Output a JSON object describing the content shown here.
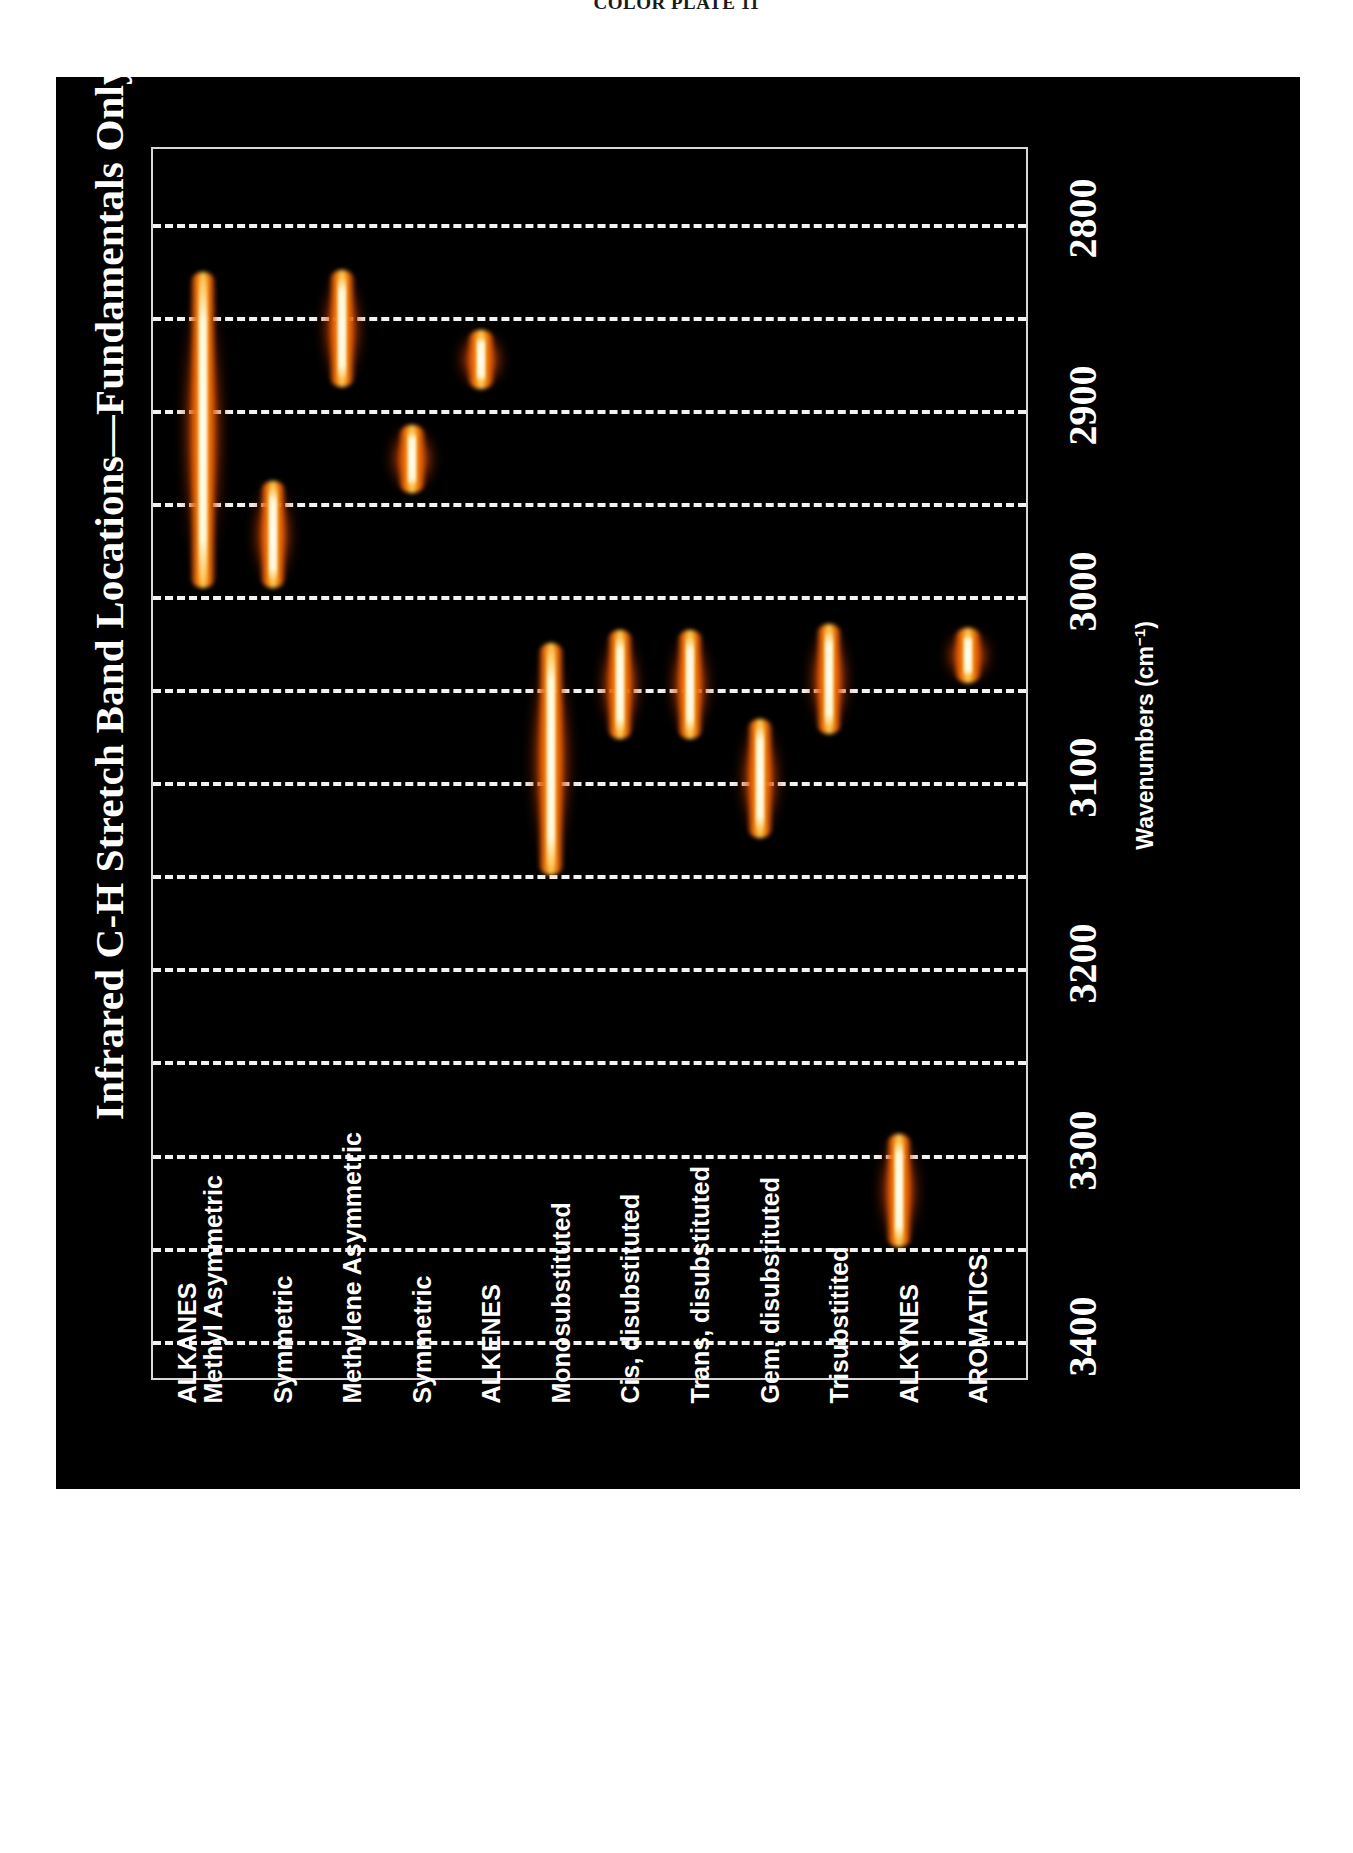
{
  "plate_caption": "COLOR PLATE 11",
  "chart_title": "Infrared C-H Stretch Band Locations—Fundamentals Only",
  "axis": {
    "title_main": "Wavenumbers (cm",
    "title_sup": "−1",
    "title_close": ")",
    "title_full": "Wavenumbers (cm−1)",
    "ticks": [
      "2800",
      "2900",
      "3000",
      "3100",
      "3200",
      "3300",
      "3400"
    ]
  },
  "colors": {
    "panel_background": "#000000",
    "page_background": "#ffffff",
    "gridline": "#f2f2f2",
    "axis_line": "#d8d8d8",
    "text": "#ffffff",
    "band_core": "#fffcee",
    "band_mid": "#fca018",
    "band_outer": "#e45c06",
    "band_halo": "#b43700"
  },
  "chart_data": {
    "type": "bar",
    "title": "Infrared C-H Stretch Band Locations—Fundamentals Only",
    "xlabel": "",
    "ylabel": "Wavenumbers (cm−1)",
    "orientation": "vertical-ranges",
    "ylim": [
      2760,
      3420
    ],
    "y_ticks": [
      2800,
      2900,
      3000,
      3100,
      3200,
      3300,
      3400
    ],
    "gridlines": [
      2800,
      2850,
      2900,
      2950,
      3000,
      3050,
      3100,
      3150,
      3200,
      3250,
      3300,
      3350,
      3400
    ],
    "grid": true,
    "legend": "none",
    "axis_direction": "2800 at top, 3400 at bottom",
    "categories": [
      "ALKANES\nMethyl Asymmetric",
      "Symmetric",
      "Methylene Asymmetric",
      "Symmetric",
      "ALKENES",
      "Monosubstituted",
      "Cis, disubstituted",
      "Trans, disubstituted",
      "Gem, disubstituted",
      "Trisubstitited",
      "ALKYNES",
      "AROMATICS"
    ],
    "bands": [
      {
        "label": "ALKANES / Methyl Asymmetric",
        "low": 2825,
        "high": 2997,
        "center": 2911
      },
      {
        "label": "Symmetric (methyl)",
        "low": 2937,
        "high": 2997,
        "center": 2967
      },
      {
        "label": "Methylene Asymmetric",
        "low": 2824,
        "high": 2889,
        "center": 2857
      },
      {
        "label": "Symmetric (methylene)",
        "low": 2907,
        "high": 2946,
        "center": 2927
      },
      {
        "label": "ALKENES",
        "low": 2856,
        "high": 2890,
        "center": 2873
      },
      {
        "label": "Monosubstituted",
        "low": 3024,
        "high": 3151,
        "center": 3088
      },
      {
        "label": "Cis, disubstituted",
        "low": 3017,
        "high": 3078,
        "center": 3048
      },
      {
        "label": "Trans, disubstituted",
        "low": 3017,
        "high": 3078,
        "center": 3048
      },
      {
        "label": "Gem, disubstituted",
        "low": 3065,
        "high": 3131,
        "center": 3098
      },
      {
        "label": "Trisubstitited",
        "low": 3014,
        "high": 3075,
        "center": 3045
      },
      {
        "label": "ALKYNES",
        "low": 3288,
        "high": 3351,
        "center": 3320
      },
      {
        "label": "AROMATICS",
        "low": 3016,
        "high": 3048,
        "center": 3032
      }
    ]
  },
  "category_labels": [
    {
      "line1": "ALKANES",
      "line2": "Methyl Asymmetric"
    },
    {
      "line1": "Symmetric",
      "line2": ""
    },
    {
      "line1": "Methylene Asymmetric",
      "line2": ""
    },
    {
      "line1": "Symmetric",
      "line2": ""
    },
    {
      "line1": "ALKENES",
      "line2": ""
    },
    {
      "line1": "Monosubstituted",
      "line2": ""
    },
    {
      "line1": "Cis, disubstituted",
      "line2": ""
    },
    {
      "line1": "Trans, disubstituted",
      "line2": ""
    },
    {
      "line1": "Gem, disubstituted",
      "line2": ""
    },
    {
      "line1": "Trisubstitited",
      "line2": ""
    },
    {
      "line1": "ALKYNES",
      "line2": ""
    },
    {
      "line1": "AROMATICS",
      "line2": ""
    }
  ]
}
